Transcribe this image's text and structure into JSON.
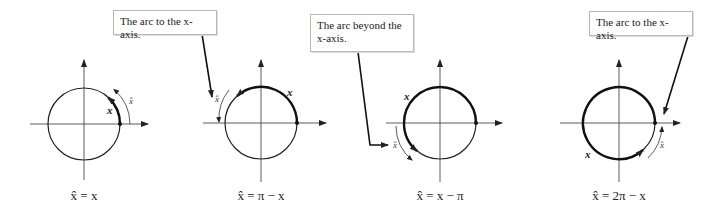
{
  "callouts": [
    {
      "text": "The arc to the x-axis."
    },
    {
      "text": "The arc beyond the x-axis."
    },
    {
      "text": "The arc to the x-axis."
    }
  ],
  "panels": [
    {
      "caption": "x̂ = x",
      "arc_label": "x",
      "ref_label": "x̂"
    },
    {
      "caption": "x̂ = π − x",
      "arc_label": "x",
      "ref_label": "x̂"
    },
    {
      "caption": "x̂ = x − π",
      "arc_label": "x",
      "ref_label": "x̂"
    },
    {
      "caption": "x̂ = 2π − x",
      "arc_label": "x",
      "ref_label": "x̂"
    }
  ]
}
